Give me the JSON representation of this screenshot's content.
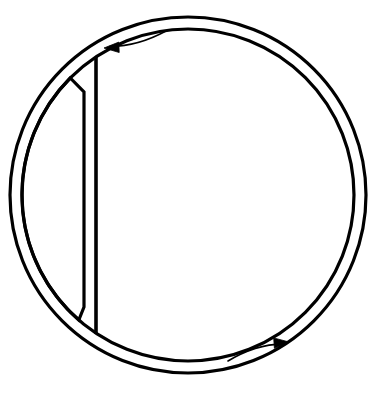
{
  "figure": {
    "type": "line-diagram",
    "background_color": "#ffffff",
    "stroke_color": "#000000",
    "fill_color": "none",
    "canvas": {
      "width": 385,
      "height": 395
    }
  },
  "geometry": {
    "center": {
      "x": 188,
      "y": 195
    },
    "outer_circle": {
      "name": "outer-circle",
      "cx": 188,
      "cy": 195,
      "r": 178,
      "stroke_width": 3.2
    },
    "inner_circle": {
      "name": "inner-circle",
      "cx": 188,
      "cy": 195,
      "r": 166,
      "stroke_width": 3.2
    },
    "chord": {
      "name": "vertical-chord",
      "x1": 96,
      "y1": 57,
      "x2": 96,
      "y2": 334,
      "stroke_width": 3.6
    },
    "sliver": {
      "name": "crescent-sliver",
      "edge_x": 84,
      "top_y": 78,
      "bottom_y": 320,
      "stroke_width": 3.2,
      "description": "Thin lens shape between inner circle left arc and a near-vertical line"
    }
  },
  "arrows": [
    {
      "name": "arrow-counterclockwise-top",
      "position": "top-left",
      "direction": "counterclockwise",
      "head_x": 104,
      "head_y": 48,
      "tail_x": 166,
      "tail_y": 31,
      "stroke_width": 1.6
    },
    {
      "name": "arrow-clockwise-bottom",
      "position": "bottom-right",
      "direction": "clockwise",
      "head_x": 289,
      "head_y": 342,
      "tail_x": 228,
      "tail_y": 361,
      "stroke_width": 1.6
    }
  ],
  "labels": {
    "figure_caption": "",
    "annotations": []
  }
}
